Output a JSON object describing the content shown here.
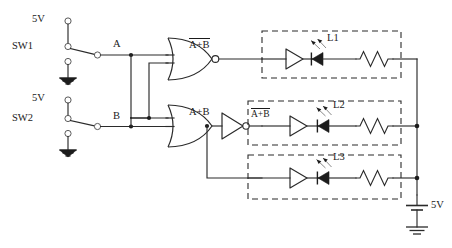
{
  "diagram": {
    "background_color": "#ffffff",
    "line_color": "#2b2b2b"
  },
  "sources": [
    {
      "id": "sw1-supply",
      "label": "5V",
      "terminal": "top"
    },
    {
      "id": "sw2-supply",
      "label": "5V",
      "terminal": "top"
    }
  ],
  "switches": [
    {
      "id": "sw1",
      "label": "SW1",
      "output_label": "A",
      "type": "spdt"
    },
    {
      "id": "sw2",
      "label": "SW2",
      "output_label": "B",
      "type": "spdt"
    }
  ],
  "signals": {
    "a": "A",
    "b": "B"
  },
  "gates": [
    {
      "id": "gate-nor",
      "type": "nor",
      "inputs": [
        "A",
        "B"
      ],
      "output_label": "A+B",
      "output_overbar": true
    },
    {
      "id": "gate-or",
      "type": "or",
      "inputs": [
        "A",
        "B"
      ],
      "output_label": "A+B",
      "output_overbar": false
    },
    {
      "id": "gate-not",
      "type": "not",
      "inputs": [
        "A+B"
      ],
      "output_label": "A+B",
      "output_overbar": true
    }
  ],
  "led_branches": [
    {
      "id": "branch-l1",
      "led_label": "L1",
      "input_label": "",
      "input_overbar": false,
      "has_buffer": true,
      "has_resistor": true
    },
    {
      "id": "branch-l2",
      "led_label": "L2",
      "input_label": "A+B",
      "input_overbar": true,
      "has_buffer": true,
      "has_resistor": true
    },
    {
      "id": "branch-l3",
      "led_label": "L3",
      "input_label": "",
      "input_overbar": false,
      "has_buffer": true,
      "has_resistor": true
    }
  ],
  "battery": {
    "id": "supply-battery",
    "label": "5V"
  },
  "grounds": [
    {
      "id": "gnd-sw1"
    },
    {
      "id": "gnd-sw2"
    },
    {
      "id": "gnd-battery"
    }
  ]
}
